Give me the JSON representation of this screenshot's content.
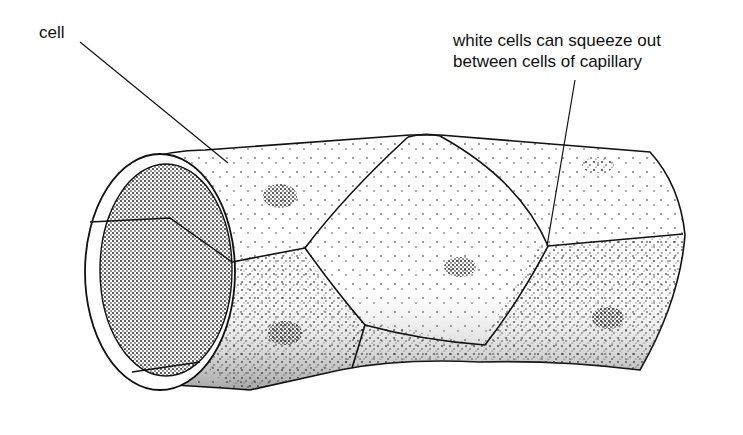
{
  "diagram": {
    "labels": [
      {
        "id": "cell",
        "text": "cell"
      },
      {
        "id": "white-cells",
        "line1": "white cells can squeeze out",
        "line2": "between cells of capillary"
      }
    ],
    "colors": {
      "ink": "#111111",
      "paper": "#ffffff"
    }
  }
}
